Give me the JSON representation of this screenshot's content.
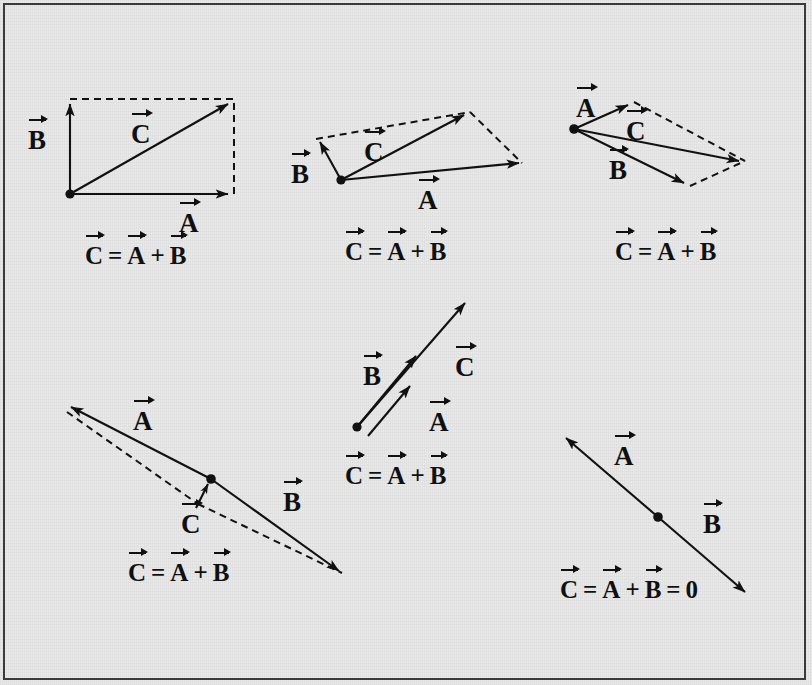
{
  "figure": {
    "background_color": "#e9e9e9",
    "ink_color": "#111111",
    "border_color": "#3a3a3a",
    "width": 812,
    "height": 685
  },
  "symbols": {
    "A": "A",
    "B": "B",
    "C": "C",
    "equals": "=",
    "plus": "+",
    "zero": "0"
  },
  "panels": [
    {
      "id": "panel-1",
      "name": "right-angle-parallelogram",
      "labels": {
        "a": "A",
        "b": "B",
        "c": "C"
      },
      "equation": {
        "lhs": "C",
        "eq": "=",
        "t1": "A",
        "plus": "+",
        "t2": "B"
      },
      "equation_text": "C = A + B"
    },
    {
      "id": "panel-2",
      "name": "obtuse-parallelogram",
      "labels": {
        "a": "A",
        "b": "B",
        "c": "C"
      },
      "equation": {
        "lhs": "C",
        "eq": "=",
        "t1": "A",
        "plus": "+",
        "t2": "B"
      },
      "equation_text": "C = A + B"
    },
    {
      "id": "panel-3",
      "name": "narrow-parallelogram",
      "labels": {
        "a": "A",
        "b": "B",
        "c": "C"
      },
      "equation": {
        "lhs": "C",
        "eq": "=",
        "t1": "A",
        "plus": "+",
        "t2": "B"
      },
      "equation_text": "C = A + B"
    },
    {
      "id": "panel-4",
      "name": "collinear-same-direction",
      "labels": {
        "a": "A",
        "b": "B",
        "c": "C"
      },
      "equation": {
        "lhs": "C",
        "eq": "=",
        "t1": "A",
        "plus": "+",
        "t2": "B"
      },
      "equation_text": "C = A + B"
    },
    {
      "id": "panel-5",
      "name": "near-antiparallel-small-resultant",
      "labels": {
        "a": "A",
        "b": "B",
        "c": "C"
      },
      "equation": {
        "lhs": "C",
        "eq": "=",
        "t1": "A",
        "plus": "+",
        "t2": "B"
      },
      "equation_text": "C = A + B"
    },
    {
      "id": "panel-6",
      "name": "exactly-antiparallel-zero-resultant",
      "labels": {
        "a": "A",
        "b": "B"
      },
      "equation": {
        "lhs": "C",
        "eq": "=",
        "t1": "A",
        "plus": "+",
        "t2": "B",
        "eq2": "=",
        "rhs": "0"
      },
      "equation_text": "C = A + B = 0"
    }
  ]
}
